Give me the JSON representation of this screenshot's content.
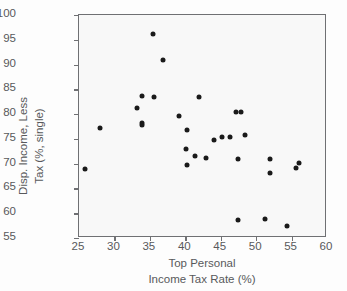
{
  "chart_data": {
    "type": "scatter",
    "title": "",
    "xlabel": "Top Personal Income Tax Rate (%)",
    "xlabel_lines": [
      "Top Personal",
      "Income Tax Rate (%)"
    ],
    "ylabel": "Disp. Income, Less Tax (%, single)",
    "ylabel_lines": [
      "Disp. Income, Less",
      "Tax (%, single)"
    ],
    "xlim": [
      25,
      60
    ],
    "ylim": [
      55,
      100
    ],
    "xticks": [
      25,
      30,
      35,
      40,
      45,
      50,
      55,
      60
    ],
    "yticks": [
      55,
      60,
      65,
      70,
      75,
      80,
      85,
      90,
      95,
      100
    ],
    "grid": false,
    "legend": null,
    "marker_color": "#1a1a1a",
    "points": [
      {
        "x": 25.9,
        "y": 68.9
      },
      {
        "x": 27.9,
        "y": 77.1
      },
      {
        "x": 33.2,
        "y": 81.2
      },
      {
        "x": 33.9,
        "y": 83.6
      },
      {
        "x": 33.9,
        "y": 78.2
      },
      {
        "x": 33.9,
        "y": 77.8
      },
      {
        "x": 35.4,
        "y": 96.1
      },
      {
        "x": 35.6,
        "y": 83.4
      },
      {
        "x": 36.8,
        "y": 90.9
      },
      {
        "x": 39.1,
        "y": 79.7
      },
      {
        "x": 40.1,
        "y": 73.0
      },
      {
        "x": 40.2,
        "y": 76.7
      },
      {
        "x": 40.3,
        "y": 69.7
      },
      {
        "x": 41.4,
        "y": 71.5
      },
      {
        "x": 41.9,
        "y": 83.4
      },
      {
        "x": 42.9,
        "y": 71.2
      },
      {
        "x": 44.0,
        "y": 74.8
      },
      {
        "x": 45.2,
        "y": 75.4
      },
      {
        "x": 46.3,
        "y": 75.3
      },
      {
        "x": 47.1,
        "y": 80.4
      },
      {
        "x": 47.8,
        "y": 80.4
      },
      {
        "x": 47.4,
        "y": 70.9
      },
      {
        "x": 48.4,
        "y": 75.7
      },
      {
        "x": 47.4,
        "y": 58.6
      },
      {
        "x": 51.2,
        "y": 58.8
      },
      {
        "x": 51.9,
        "y": 71.0
      },
      {
        "x": 51.9,
        "y": 68.2
      },
      {
        "x": 54.3,
        "y": 57.4
      },
      {
        "x": 55.6,
        "y": 69.2
      },
      {
        "x": 56.0,
        "y": 70.2
      }
    ]
  }
}
